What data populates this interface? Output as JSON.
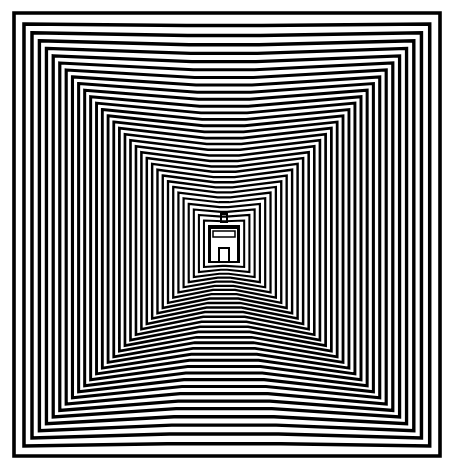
{
  "artwork": {
    "kind": "op-art concentric squares with central figure",
    "colors": {
      "background": "#ffffff",
      "stroke": "#000000"
    },
    "outer": {
      "x": 14,
      "y": 13,
      "w": 426,
      "h": 443
    },
    "inner": {
      "x": 209,
      "y": 226,
      "w": 30,
      "h": 36
    },
    "center": {
      "x": 224,
      "y": 240
    },
    "rings": 34,
    "stroke_width": 3.6
  }
}
